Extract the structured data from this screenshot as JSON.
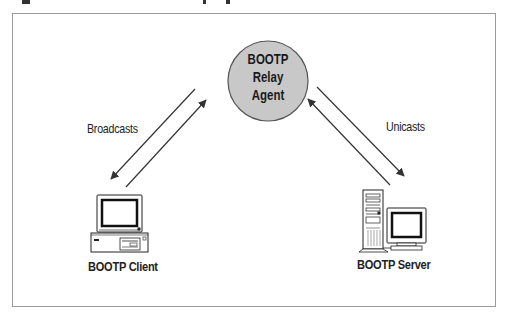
{
  "diagram": {
    "type": "network-relay",
    "frame": {
      "border_color": "#9a9a9a",
      "background": "#ffffff"
    },
    "colors": {
      "agent_fill": "#c8c8c8",
      "agent_stroke": "#555555",
      "line": "#333333",
      "text": "#222222"
    },
    "nodes": {
      "relay_agent": {
        "lines": [
          "BOOTP",
          "Relay",
          "Agent"
        ],
        "shape": "circle"
      },
      "client": {
        "label": "BOOTP Client",
        "icon": "desktop-computer-icon"
      },
      "server": {
        "label": "BOOTP Server",
        "icon": "tower-server-icon"
      }
    },
    "edges": [
      {
        "from": "client",
        "to": "relay_agent",
        "label": "Broadcasts",
        "bidirectional": true
      },
      {
        "from": "relay_agent",
        "to": "server",
        "label": "Unicasts",
        "bidirectional": true
      }
    ]
  }
}
